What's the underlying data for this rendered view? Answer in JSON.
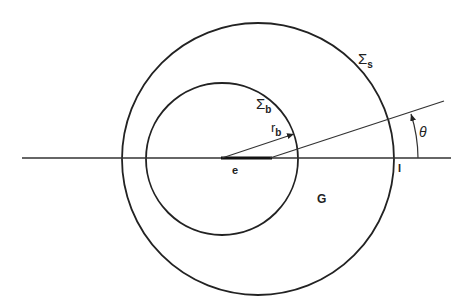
{
  "diagram": {
    "labels": {
      "sigma_s": {
        "main": "Σ",
        "sub": "s"
      },
      "sigma_b": {
        "main": "Σ",
        "sub": "b"
      },
      "r_b": {
        "main": "r",
        "sub": "b"
      },
      "theta": "θ",
      "e": "e",
      "G": "G",
      "I": "I"
    },
    "colors": {
      "stroke": "#222222",
      "background": "#ffffff"
    },
    "geometry": {
      "outer_circle": {
        "cx": 258,
        "cy": 159,
        "r": 136
      },
      "inner_circle": {
        "cx": 222,
        "cy": 159,
        "r": 76
      },
      "horizontal_axis": {
        "x1": 22,
        "x2": 451,
        "y": 158
      },
      "thick_segment": {
        "x1": 221,
        "x2": 272,
        "y": 158
      },
      "slant_line": {
        "x1": 270,
        "y1": 158,
        "x2": 444,
        "y2": 101
      },
      "r_b_arrow": {
        "x1": 222,
        "y1": 158,
        "x2": 294,
        "y2": 134
      }
    }
  }
}
